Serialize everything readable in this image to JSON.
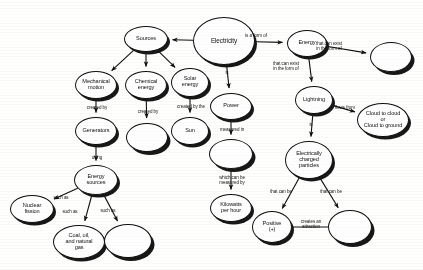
{
  "diagram": {
    "type": "concept-map",
    "style": {
      "node_fill": "#ffffff",
      "node_stroke": "#111111",
      "shadow_color": "#1a1a1a",
      "background": "#fdfdfc",
      "text_color": "#121212"
    },
    "nodes": [
      {
        "id": "electricity",
        "label": "Electricity",
        "cx": 224,
        "cy": 41,
        "rx": 31,
        "ry": 24,
        "empty": false,
        "big": true
      },
      {
        "id": "sources",
        "label": "Sources",
        "cx": 146,
        "cy": 39,
        "rx": 22,
        "ry": 13,
        "empty": false,
        "big": false
      },
      {
        "id": "energy",
        "label": "Energy",
        "cx": 307,
        "cy": 43,
        "rx": 20,
        "ry": 13.5,
        "empty": false,
        "big": false
      },
      {
        "id": "energy-blank",
        "label": "",
        "cx": 391,
        "cy": 57,
        "rx": 21,
        "ry": 15,
        "empty": true,
        "big": false
      },
      {
        "id": "mechanical",
        "label": "Mechanical\nmotion",
        "cx": 96,
        "cy": 85,
        "rx": 21,
        "ry": 14,
        "empty": false,
        "big": false
      },
      {
        "id": "chemical",
        "label": "Chemical\nenergy",
        "cx": 146,
        "cy": 85,
        "rx": 21,
        "ry": 14,
        "empty": false,
        "big": false
      },
      {
        "id": "solar",
        "label": "Solar\nenergy",
        "cx": 190,
        "cy": 82,
        "rx": 19,
        "ry": 14.5,
        "empty": false,
        "big": false
      },
      {
        "id": "generators",
        "label": "Generators",
        "cx": 96,
        "cy": 131,
        "rx": 21,
        "ry": 14,
        "empty": false,
        "big": false
      },
      {
        "id": "chem-blank",
        "label": "",
        "cx": 147,
        "cy": 137,
        "rx": 21,
        "ry": 14.5,
        "empty": true,
        "big": false
      },
      {
        "id": "sun",
        "label": "Sun",
        "cx": 190,
        "cy": 131,
        "rx": 19,
        "ry": 14,
        "empty": false,
        "big": false
      },
      {
        "id": "energy-src",
        "label": "Energy\nsources",
        "cx": 96,
        "cy": 180,
        "rx": 22,
        "ry": 15,
        "empty": false,
        "big": false
      },
      {
        "id": "nuclear",
        "label": "Nuclear\nfission",
        "cx": 32,
        "cy": 209,
        "rx": 22,
        "ry": 14,
        "empty": false,
        "big": false
      },
      {
        "id": "coal",
        "label": "Coal, oil,\nand natural\ngas",
        "cx": 79,
        "cy": 242,
        "rx": 26,
        "ry": 17,
        "empty": false,
        "big": false
      },
      {
        "id": "src-blank",
        "label": "",
        "cx": 128,
        "cy": 241,
        "rx": 24,
        "ry": 17,
        "empty": true,
        "big": false
      },
      {
        "id": "power",
        "label": "Power",
        "cx": 231,
        "cy": 106,
        "rx": 21,
        "ry": 13.5,
        "empty": false,
        "big": false
      },
      {
        "id": "power-blank",
        "label": "",
        "cx": 231,
        "cy": 154,
        "rx": 22,
        "ry": 15,
        "empty": true,
        "big": false
      },
      {
        "id": "kilowatts",
        "label": "Kilowatts\nper hour",
        "cx": 231,
        "cy": 208,
        "rx": 21,
        "ry": 14,
        "empty": false,
        "big": false
      },
      {
        "id": "lightning",
        "label": "Lightning",
        "cx": 314,
        "cy": 100,
        "rx": 19,
        "ry": 14,
        "empty": false,
        "big": false
      },
      {
        "id": "cloud",
        "label": "Cloud to cloud\nor\nCloud to ground",
        "cx": 383,
        "cy": 120,
        "rx": 26,
        "ry": 17,
        "empty": false,
        "big": false
      },
      {
        "id": "charged",
        "label": "Electrically\ncharged\nparticles",
        "cx": 309,
        "cy": 160,
        "rx": 24,
        "ry": 19,
        "empty": false,
        "big": false
      },
      {
        "id": "positive",
        "label": "Positive\n(+)",
        "cx": 272,
        "cy": 227,
        "rx": 20,
        "ry": 16,
        "empty": false,
        "big": false
      },
      {
        "id": "neg-blank",
        "label": "",
        "cx": 350,
        "cy": 227,
        "rx": 22,
        "ry": 17,
        "empty": true,
        "big": false
      }
    ],
    "edges": [
      {
        "id": "e-elec-sources",
        "from": "electricity",
        "to": "sources",
        "label": "",
        "lx": 0,
        "ly": 0
      },
      {
        "id": "e-elec-energy",
        "from": "electricity",
        "to": "energy",
        "label": "is a form of",
        "lx": 256,
        "ly": 36
      },
      {
        "id": "e-elec-power",
        "from": "electricity",
        "to": "power",
        "label": "is",
        "lx": 227,
        "ly": 73
      },
      {
        "id": "e-energy-blank",
        "from": "energy",
        "to": "energy-blank",
        "label": "that can exist\nin the form of",
        "lx": 329,
        "ly": 46
      },
      {
        "id": "e-energy-light",
        "from": "energy",
        "to": "lightning",
        "label": "that can exist\nin the form of",
        "lx": 286,
        "ly": 66
      },
      {
        "id": "e-src-mech",
        "from": "sources",
        "to": "mechanical",
        "label": "",
        "lx": 0,
        "ly": 0
      },
      {
        "id": "e-src-chem",
        "from": "sources",
        "to": "chemical",
        "label": "",
        "lx": 0,
        "ly": 0
      },
      {
        "id": "e-src-solar",
        "from": "sources",
        "to": "solar",
        "label": "",
        "lx": 0,
        "ly": 0
      },
      {
        "id": "e-mech-gen",
        "from": "mechanical",
        "to": "generators",
        "label": "created by",
        "lx": 97,
        "ly": 108
      },
      {
        "id": "e-chem-blank",
        "from": "chemical",
        "to": "chem-blank",
        "label": "created by",
        "lx": 148,
        "ly": 112
      },
      {
        "id": "e-solar-sun",
        "from": "solar",
        "to": "sun",
        "label": "created by the",
        "lx": 191,
        "ly": 107
      },
      {
        "id": "e-gen-energysrc",
        "from": "generators",
        "to": "energy-src",
        "label": "using",
        "lx": 97,
        "ly": 158
      },
      {
        "id": "e-esrc-nuclear",
        "from": "energy-src",
        "to": "nuclear",
        "label": "such as",
        "lx": 61,
        "ly": 198
      },
      {
        "id": "e-esrc-coal",
        "from": "energy-src",
        "to": "coal",
        "label": "such as",
        "lx": 70,
        "ly": 212
      },
      {
        "id": "e-esrc-blank",
        "from": "energy-src",
        "to": "src-blank",
        "label": "such as",
        "lx": 108,
        "ly": 211
      },
      {
        "id": "e-power-blank",
        "from": "power",
        "to": "power-blank",
        "label": "measured in",
        "lx": 232,
        "ly": 130
      },
      {
        "id": "e-blank-kw",
        "from": "power-blank",
        "to": "kilowatts",
        "label": "which can be\nmeasured by",
        "lx": 232,
        "ly": 180
      },
      {
        "id": "e-light-cloud",
        "from": "lightning",
        "to": "cloud",
        "label": "flows from",
        "lx": 345,
        "ly": 108
      },
      {
        "id": "e-light-charged",
        "from": "lightning",
        "to": "charged",
        "label": "is",
        "lx": 311,
        "ly": 125
      },
      {
        "id": "e-charged-pos",
        "from": "charged",
        "to": "positive",
        "label": "that can be",
        "lx": 281,
        "ly": 192
      },
      {
        "id": "e-charged-neg",
        "from": "charged",
        "to": "neg-blank",
        "label": "that can be",
        "lx": 331,
        "ly": 192
      },
      {
        "id": "e-pos-neg",
        "from": "positive",
        "to": "neg-blank",
        "label": "creates an\nattraction",
        "lx": 311,
        "ly": 224
      }
    ]
  }
}
